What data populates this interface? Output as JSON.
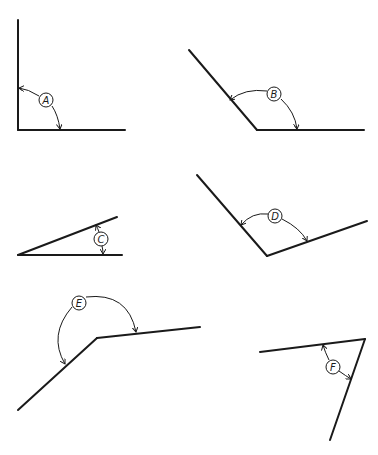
{
  "diagram": {
    "title": "",
    "angles": [
      {
        "label": "A",
        "type": "right"
      },
      {
        "label": "B",
        "type": "obtuse"
      },
      {
        "label": "C",
        "type": "acute"
      },
      {
        "label": "D",
        "type": "obtuse"
      },
      {
        "label": "E",
        "type": "obtuse"
      },
      {
        "label": "F",
        "type": "acute"
      }
    ]
  },
  "colors": {
    "line": "#1a1a1a",
    "background": "#ffffff"
  }
}
